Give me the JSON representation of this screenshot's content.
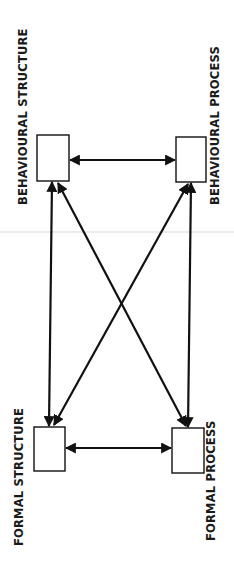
{
  "diagram": {
    "colors": {
      "background": "#ffffff",
      "stroke": "#111111",
      "text": "#1a1a1a",
      "scanline": "#e6e6e6"
    },
    "nodes": [
      {
        "id": "behavioural-structure",
        "label": "BEHAVIOURAL STRUCTURE",
        "box": {
          "x": 37,
          "y": 135,
          "w": 32,
          "h": 46
        }
      },
      {
        "id": "behavioural-process",
        "label": "BEHAVIOURAL PROCESS",
        "box": {
          "x": 176,
          "y": 137,
          "w": 30,
          "h": 45
        }
      },
      {
        "id": "formal-structure",
        "label": "FORMAL STRUCTURE",
        "box": {
          "x": 34,
          "y": 427,
          "w": 31,
          "h": 44
        }
      },
      {
        "id": "formal-process",
        "label": "FORMAL PROCESS",
        "box": {
          "x": 172,
          "y": 428,
          "w": 32,
          "h": 45
        }
      }
    ],
    "edges": [
      {
        "from": "behavioural-structure",
        "to": "behavioural-process",
        "direction": "both"
      },
      {
        "from": "formal-structure",
        "to": "formal-process",
        "direction": "both"
      },
      {
        "from": "behavioural-structure",
        "to": "formal-structure",
        "direction": "both"
      },
      {
        "from": "behavioural-process",
        "to": "formal-process",
        "direction": "both"
      },
      {
        "from": "behavioural-structure",
        "to": "formal-process",
        "direction": "both"
      },
      {
        "from": "behavioural-process",
        "to": "formal-structure",
        "direction": "both"
      }
    ]
  }
}
